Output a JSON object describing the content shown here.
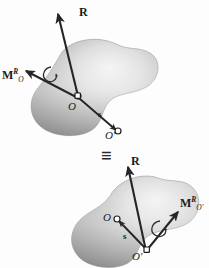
{
  "figure": {
    "background_color": "#fdfdfd",
    "body_fill_dark": "#8e8e8e",
    "body_fill_light": "#e9e9e9",
    "vector_color": "#262626",
    "equivalence_symbol": "≡"
  },
  "upper_system": {
    "name": "force-couple-system-at-O",
    "resultant_force_label": "R",
    "couple_moment_label": "M",
    "couple_moment_superscript": "R",
    "couple_moment_subscript": "O",
    "origin_point_label": "O",
    "second_point_label": "O'",
    "position_vector_label": "s"
  },
  "lower_system": {
    "name": "force-couple-system-at-O-prime",
    "resultant_force_label": "R",
    "couple_moment_label": "M",
    "couple_moment_superscript": "R",
    "couple_moment_subscript": "O'",
    "origin_point_label": "O",
    "second_point_label": "O'",
    "position_vector_label": "s"
  },
  "icons": {
    "arrowhead": "vector-arrowhead-icon",
    "curved_rotation": "curved-rotation-arrow-icon",
    "point_marker": "point-marker-circle-icon"
  }
}
